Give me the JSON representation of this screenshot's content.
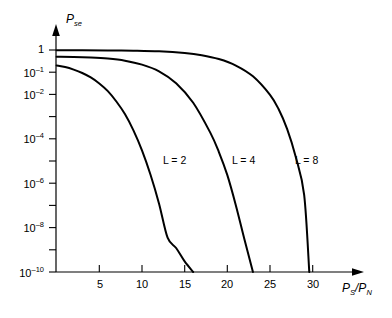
{
  "chart_data": {
    "type": "line",
    "title": "",
    "xlabel": "P_S/P_N",
    "ylabel": "P_se",
    "xlim": [
      0,
      32
    ],
    "ylim": [
      1e-10,
      1.5
    ],
    "yscale": "log",
    "grid": false,
    "legend_position": "inline-annotations",
    "x_ticks": [
      5,
      10,
      15,
      20,
      25,
      30
    ],
    "x_tick_labels": [
      "5",
      "10",
      "15",
      "20",
      "25",
      "30"
    ],
    "y_ticks": [
      1,
      0.1,
      0.01,
      0.001,
      0.0001,
      1e-05,
      1e-06,
      1e-07,
      1e-08,
      1e-09,
      1e-10
    ],
    "y_tick_labels": [
      "1",
      "10-1",
      "10-2",
      "",
      "10-4",
      "",
      "10-6",
      "",
      "10-8",
      "",
      "10-10"
    ],
    "series": [
      {
        "name": "L = 2",
        "label": "L = 2",
        "x": [
          0,
          1,
          2,
          3,
          4,
          5,
          6,
          7,
          8,
          9,
          10,
          11,
          12,
          13,
          14,
          15,
          16
        ],
        "y": [
          0.2,
          0.17,
          0.13,
          0.092,
          0.058,
          0.031,
          0.014,
          0.0048,
          0.0013,
          0.00024,
          3e-05,
          2.4e-06,
          1.2e-07,
          3.5e-09,
          1.2e-09,
          3e-10,
          1e-10
        ]
      },
      {
        "name": "L = 4",
        "label": "L = 4",
        "x": [
          0,
          2,
          4,
          6,
          8,
          10,
          12,
          14,
          16,
          18,
          19,
          20,
          21,
          22,
          23
        ],
        "y": [
          0.5,
          0.49,
          0.46,
          0.41,
          0.33,
          0.22,
          0.11,
          0.032,
          0.0042,
          0.00019,
          2.6e-05,
          2.3e-06,
          1e-07,
          3e-09,
          1e-10
        ]
      },
      {
        "name": "L = 8",
        "label": "L = 8",
        "x": [
          0,
          3,
          6,
          9,
          12,
          15,
          17,
          19,
          21,
          23,
          25,
          26,
          27,
          28,
          29,
          29.6
        ],
        "y": [
          0.97,
          0.965,
          0.955,
          0.93,
          0.87,
          0.73,
          0.58,
          0.39,
          0.2,
          0.065,
          0.0095,
          0.0022,
          0.00028,
          1.6e-05,
          3e-07,
          1e-10
        ]
      }
    ]
  },
  "labels": {
    "y_axis_title_main": "P",
    "y_axis_title_sub": "se",
    "x_axis_title_p1": "P",
    "x_axis_title_sub1": "S",
    "x_axis_title_slash": "/P",
    "x_axis_title_sub2": "N",
    "y_1": "1",
    "y_e1_base": "10",
    "y_e1_exp": "–1",
    "y_e2_base": "10",
    "y_e2_exp": "–2",
    "y_e4_base": "10",
    "y_e4_exp": "–4",
    "y_e6_base": "10",
    "y_e6_exp": "–6",
    "y_e8_base": "10",
    "y_e8_exp": "–8",
    "y_e10_base": "10",
    "y_e10_exp": "–10",
    "x_5": "5",
    "x_10": "10",
    "x_15": "15",
    "x_20": "20",
    "x_25": "25",
    "x_30": "30",
    "curve_l2": "L = 2",
    "curve_l4": "L = 4",
    "curve_l8": "L = 8"
  },
  "colors": {
    "axis": "#000000",
    "curve": "#000000",
    "background": "#ffffff"
  }
}
